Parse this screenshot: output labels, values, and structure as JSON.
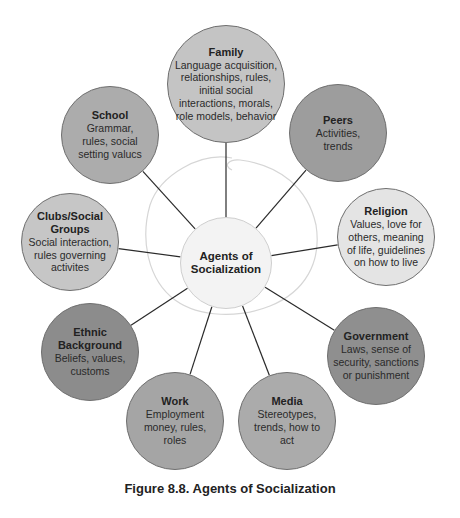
{
  "diagram": {
    "center": {
      "label": "Agents of Socialization",
      "title_line1": "Agents of",
      "title_line2": "Socialization",
      "x": 226,
      "y": 263,
      "r": 46,
      "color": "#f3f3f3"
    },
    "nodes": [
      {
        "id": "family",
        "title": "Family",
        "desc": "Language acquisition, relationships, rules, initial social interactions, morals, role models, behavior",
        "x": 226,
        "y": 84,
        "r": 59,
        "color": "#c4c4c4",
        "desc_width": 104
      },
      {
        "id": "peers",
        "title": "Peers",
        "desc": "Activities, trends",
        "x": 338,
        "y": 133,
        "r": 49,
        "color": "#9d9d9d",
        "desc_width": 60
      },
      {
        "id": "religion",
        "title": "Religion",
        "desc": "Values, love for others, meaning of life, guidelines on how to live",
        "x": 386,
        "y": 237,
        "r": 49,
        "color": "#e4e4e4",
        "desc_width": 80
      },
      {
        "id": "government",
        "title": "Government",
        "desc": "Laws, sense of security, sanctions or punishment",
        "x": 376,
        "y": 356,
        "r": 49,
        "color": "#8f8f8f",
        "desc_width": 90
      },
      {
        "id": "media",
        "title": "Media",
        "desc": "Stereotypes, trends, how to act",
        "x": 287,
        "y": 421,
        "r": 49,
        "color": "#ababab",
        "desc_width": 70
      },
      {
        "id": "work",
        "title": "Work",
        "desc": "Employment money, rules, roles",
        "x": 175,
        "y": 421,
        "r": 49,
        "color": "#a5a5a5",
        "desc_width": 68
      },
      {
        "id": "ethnic-background",
        "title": "Ethnic Background",
        "desc": "Beliefs, values, customs",
        "x": 90,
        "y": 352,
        "r": 49,
        "color": "#8c8c8c",
        "desc_width": 80
      },
      {
        "id": "clubs-social-groups",
        "title": "Clubs/Social Groups",
        "desc": "Social interaction, rules governing activites",
        "x": 70,
        "y": 242,
        "r": 49,
        "color": "#c6c6c6",
        "desc_width": 90
      },
      {
        "id": "school",
        "title": "School",
        "desc": "Grammar, rules, social setting valucs",
        "x": 110,
        "y": 135,
        "r": 49,
        "color": "#acacac",
        "desc_width": 70
      }
    ]
  },
  "caption": "Figure 8.8.  Agents of Socialization"
}
